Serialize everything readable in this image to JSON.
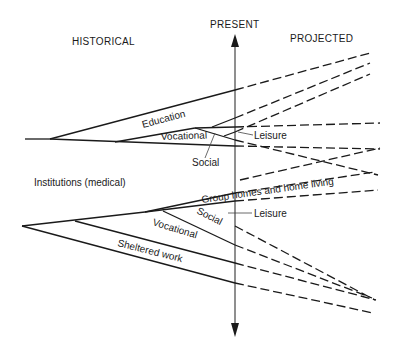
{
  "headers": {
    "historical": "HISTORICAL",
    "present": "PRESENT",
    "projected": "PROJECTED"
  },
  "labels": {
    "education": "Education",
    "vocational_top": "Vocational",
    "social_top": "Social",
    "leisure_top": "Leisure",
    "institutions": "Institutions (medical)",
    "group_homes": "Group homes and home living",
    "social_bottom": "Social",
    "leisure_bottom": "Leisure",
    "vocational_bottom": "Vocational",
    "sheltered_work": "Sheltered work"
  },
  "colors": {
    "line": "#1a1a1a",
    "background": "#ffffff"
  }
}
